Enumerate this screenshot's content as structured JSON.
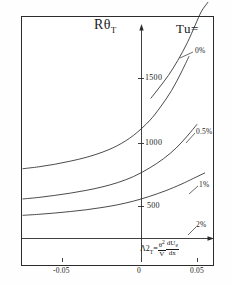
{
  "chart_data": {
    "type": "line",
    "title": "",
    "ylabel": "RθT",
    "ylabel_main": "Rθ",
    "ylabel_sub": "T",
    "xlabel_formula": "Λ2T = (θ²/V)(dUe/dx)",
    "legend_title": "Tu=",
    "legend_position": "top-right",
    "grid": false,
    "xlim": [
      -0.075,
      0.06
    ],
    "ylim": [
      0,
      2150
    ],
    "xticks": [
      -0.05,
      0,
      0.05
    ],
    "xtick_labels": [
      "-0.05",
      "0",
      "0.05"
    ],
    "yticks": [
      500,
      1000,
      1500
    ],
    "ytick_labels": [
      "500",
      "1000",
      "1500"
    ],
    "series": [
      {
        "name": "0%",
        "label": "0%",
        "x": [
          0.006,
          0.011,
          0.017,
          0.023,
          0.029,
          0.034,
          0.038,
          0.042
        ],
        "values": [
          1360,
          1440,
          1540,
          1660,
          1800,
          1940,
          2050,
          2120
        ]
      },
      {
        "name": "0.5%",
        "label": "0.5%",
        "x": [
          -0.075,
          -0.065,
          -0.055,
          -0.045,
          -0.035,
          -0.025,
          -0.015,
          -0.005,
          0.005,
          0.012,
          0.019,
          0.025,
          0.03
        ],
        "values": [
          800,
          815,
          835,
          860,
          890,
          930,
          985,
          1065,
          1180,
          1290,
          1420,
          1560,
          1690
        ]
      },
      {
        "name": "1%",
        "label": "1%",
        "x": [
          -0.075,
          -0.065,
          -0.055,
          -0.045,
          -0.035,
          -0.025,
          -0.015,
          -0.005,
          0.005,
          0.014,
          0.022,
          0.029,
          0.035
        ],
        "values": [
          560,
          572,
          588,
          606,
          628,
          655,
          690,
          738,
          805,
          880,
          965,
          1060,
          1150
        ]
      },
      {
        "name": "2%",
        "label": "2%",
        "x": [
          -0.075,
          -0.065,
          -0.055,
          -0.045,
          -0.035,
          -0.025,
          -0.015,
          -0.005,
          0.005,
          0.015,
          0.025,
          0.033,
          0.04
        ],
        "values": [
          430,
          438,
          448,
          460,
          474,
          492,
          514,
          543,
          580,
          624,
          676,
          724,
          766
        ]
      }
    ],
    "axis_color": "#2b2b2b",
    "curve_color": "#2b2b2b",
    "background_color": "#ffffff"
  }
}
